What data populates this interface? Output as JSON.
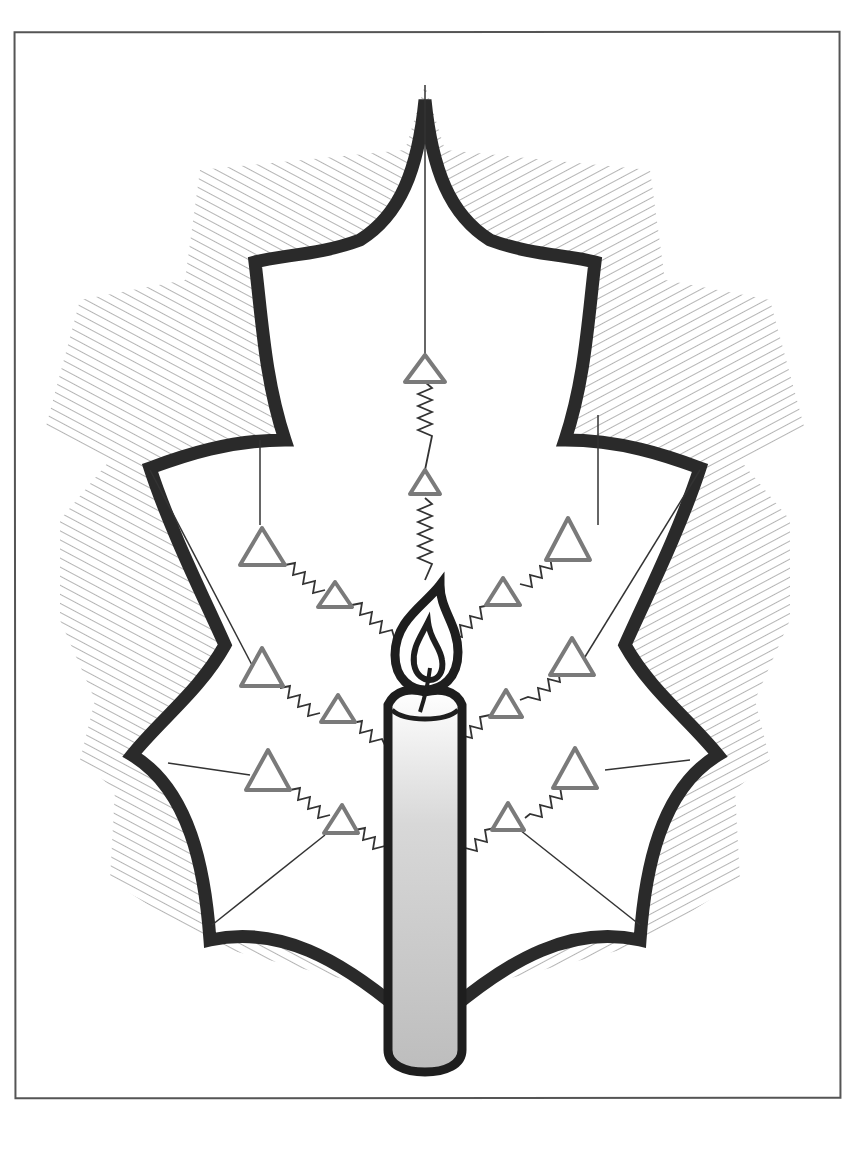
{
  "illustration": {
    "subject": "Holly leaf ornament with lit candle",
    "colors": {
      "outline": "#2a2a2a",
      "hatch": "#6a6a6a",
      "ornament": "#7a7a7a",
      "candle_fill": "#c4c4c4",
      "background": "#ffffff",
      "frame": "#555555"
    },
    "ornament_count": 11,
    "candle_count": 1
  }
}
